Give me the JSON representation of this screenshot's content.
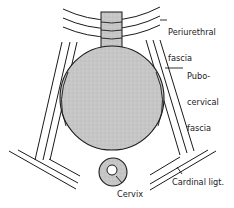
{
  "diagram": {
    "labels": {
      "periurethral_line1": "Periurethral",
      "periurethral_line2": "fascia",
      "pubocervical_line1": "Pubo-",
      "pubocervical_line2": "cervical",
      "pubocervical_line3": "fascia",
      "cardinal": "Cardinal ligt.",
      "cervix": "Cervix"
    },
    "structures": [
      "urethra",
      "bladder",
      "periurethral-fascia",
      "pubocervical-fascia",
      "cardinal-ligament",
      "cervix"
    ],
    "colors": {
      "ink": "#1a1a1a",
      "fill_gray": "#c4c4c4",
      "background": "#ffffff"
    }
  }
}
